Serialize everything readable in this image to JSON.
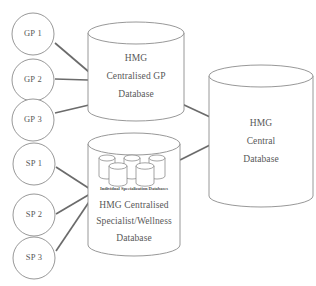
{
  "diagram": {
    "background_color": "#ffffff",
    "stroke_color": "#8c8c8c",
    "connector_color": "#6b6b6b",
    "text_color": "#585858",
    "gp_nodes": [
      {
        "id": "gp1",
        "label": "GP 1"
      },
      {
        "id": "gp2",
        "label": "GP 2"
      },
      {
        "id": "gp3",
        "label": "GP 3"
      }
    ],
    "sp_nodes": [
      {
        "id": "sp1",
        "label": "SP 1"
      },
      {
        "id": "sp2",
        "label": "SP 2"
      },
      {
        "id": "sp3",
        "label": "SP 3"
      }
    ],
    "gp_database": {
      "id": "gp-db",
      "lines": [
        "HMG",
        "Centralised GP",
        "Database"
      ]
    },
    "specialist_database": {
      "id": "specialist-db",
      "inner_caption": "Individual Specialization Databases",
      "inner_cylinder_count": 5,
      "lines": [
        "HMG Centralised",
        "Specialist/Wellness",
        "Database"
      ]
    },
    "central_database": {
      "id": "central-db",
      "lines": [
        "HMG",
        "Central",
        "Database"
      ]
    }
  }
}
